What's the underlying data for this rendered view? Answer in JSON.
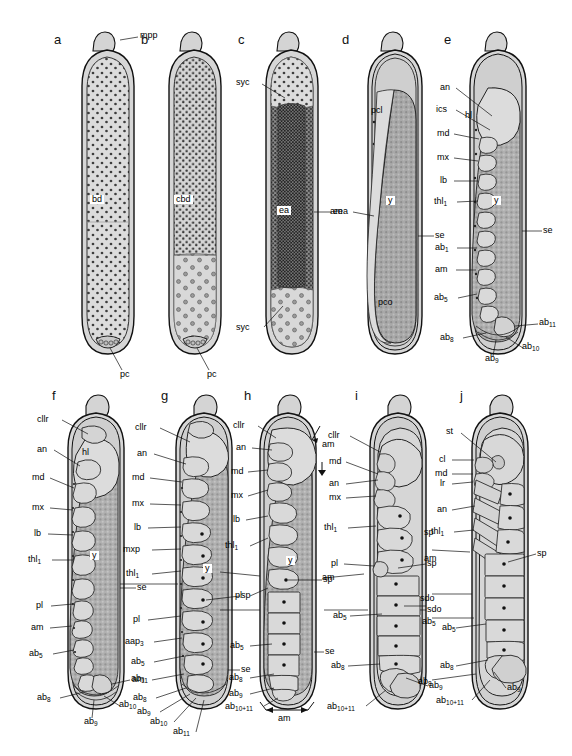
{
  "figure": {
    "type": "scientific-illustration",
    "panel_count": 10
  },
  "panels": [
    {
      "letter": "a",
      "internal_labels": [
        "bd"
      ],
      "callout_labels": [
        "mpp",
        "pc"
      ]
    },
    {
      "letter": "b",
      "internal_labels": [
        "cbd"
      ],
      "callout_labels": [
        "pc"
      ]
    },
    {
      "letter": "c",
      "internal_labels": [
        "ea"
      ],
      "callout_labels": [
        "syc",
        "syc",
        "eea"
      ]
    },
    {
      "letter": "d",
      "internal_labels": [
        "y"
      ],
      "callout_labels": [
        "pcl",
        "pco",
        "am",
        "se"
      ]
    },
    {
      "letter": "e",
      "internal_labels": [
        "hl",
        "y"
      ],
      "callout_labels": [
        "an",
        "ics",
        "md",
        "mx",
        "lb",
        "thl1",
        "ab1",
        "am",
        "ab5",
        "se",
        "ab11",
        "ab8",
        "ab9",
        "ab10"
      ]
    },
    {
      "letter": "f",
      "internal_labels": [
        "hl",
        "y"
      ],
      "callout_labels": [
        "cllr",
        "an",
        "md",
        "mx",
        "lb",
        "thl1",
        "se",
        "pl",
        "am",
        "ab5",
        "ab8",
        "ab9",
        "ab11",
        "ab10"
      ]
    },
    {
      "letter": "g",
      "internal_labels": [
        "y"
      ],
      "callout_labels": [
        "cllr",
        "an",
        "md",
        "mx",
        "lb",
        "mxp",
        "thl1",
        "se",
        "pl",
        "sp",
        "aap3",
        "ab5",
        "am",
        "ab8",
        "ab9",
        "ab10",
        "ab11"
      ]
    },
    {
      "letter": "h",
      "internal_labels": [
        "y"
      ],
      "callout_labels": [
        "cllr",
        "an",
        "md",
        "mx",
        "lb",
        "thl1",
        "sp",
        "pl",
        "se",
        "am",
        "ab5",
        "ab8",
        "ab9",
        "ab10+11",
        "am"
      ]
    },
    {
      "letter": "i",
      "internal_labels": [],
      "callout_labels": [
        "cllr",
        "md",
        "an",
        "mx",
        "thl1",
        "pl",
        "sp",
        "sdo",
        "am",
        "ab5",
        "ab8",
        "ab9",
        "ab10+11"
      ]
    },
    {
      "letter": "j",
      "internal_labels": [],
      "callout_labels": [
        "st",
        "cl",
        "md",
        "lr",
        "an",
        "thl1",
        "sp",
        "sdo",
        "am",
        "ab5",
        "ab8",
        "ab9",
        "ab10+11"
      ]
    }
  ],
  "label_text": {
    "a": "a",
    "b": "b",
    "c": "c",
    "d": "d",
    "e": "e",
    "f": "f",
    "g": "g",
    "h": "h",
    "i": "i",
    "j": "j",
    "mpp": "mpp",
    "bd": "bd",
    "pc": "pc",
    "cbd": "cbd",
    "syc": "syc",
    "ea": "ea",
    "eea": "eea",
    "am": "am",
    "pcl": "pcl",
    "pco": "pco",
    "y": "y",
    "se": "se",
    "hl": "hl",
    "an": "an",
    "ics": "ics",
    "md": "md",
    "mx": "mx",
    "lb": "lb",
    "mxp": "mxp",
    "cllr": "cllr",
    "pl": "pl",
    "sp": "sp",
    "sdo": "sdo",
    "st": "st",
    "cl": "cl",
    "lr": "lr",
    "aap": "aap",
    "thl": "thl",
    "ab": "ab",
    "sub1": "1",
    "sub3": "3",
    "sub5": "5",
    "sub8": "8",
    "sub9": "9",
    "sub10": "10",
    "sub11": "11",
    "sub10_11": "10+11"
  },
  "colors": {
    "ink": "#111111",
    "chorion_fill": "#d8d8d8",
    "serosa_fill": "#c9c9c9",
    "yolk_fill": "#a9a9a9",
    "embryo_fill": "#d2d2d2",
    "dark_cells": "#4a4a4a",
    "background": "#ffffff"
  }
}
